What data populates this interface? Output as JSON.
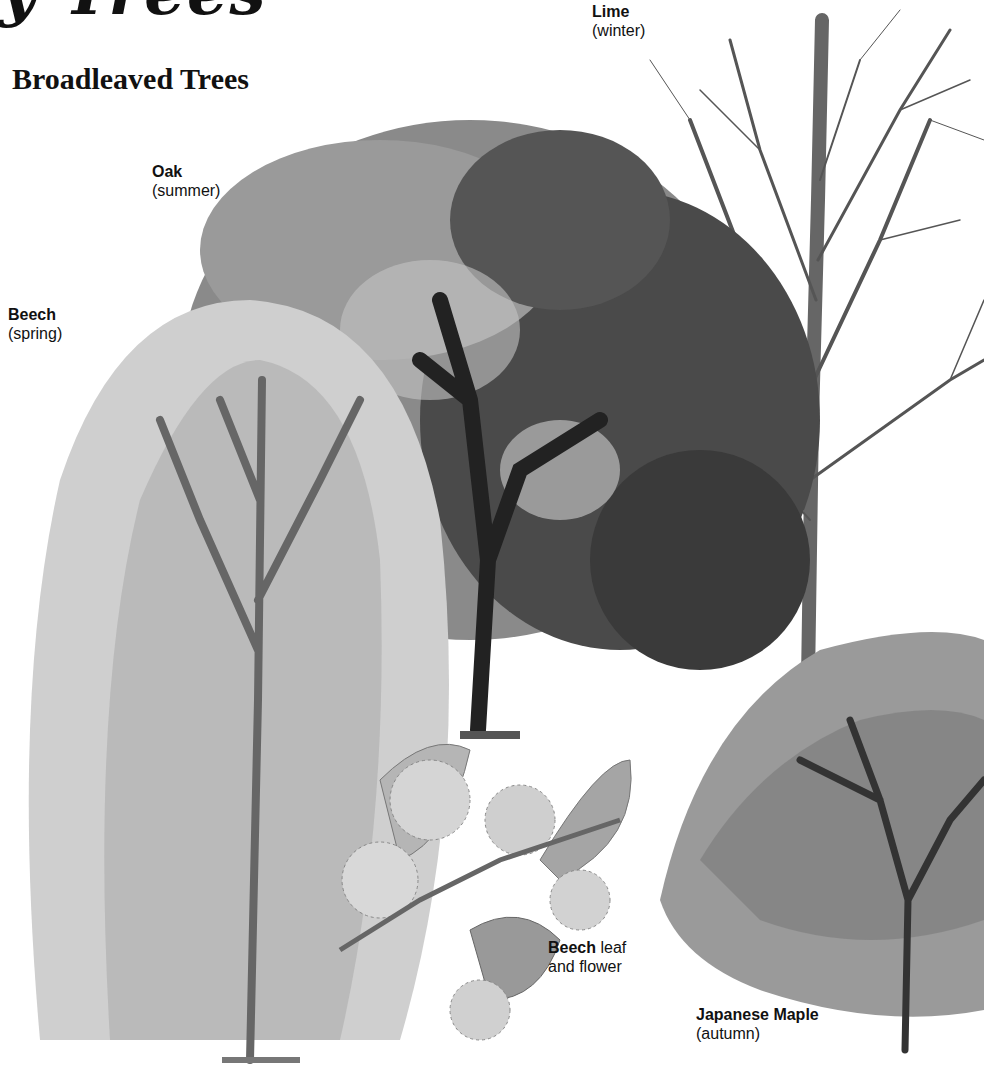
{
  "page": {
    "heading_cropped": "y Trees",
    "section_title": "Broadleaved Trees"
  },
  "labels": {
    "lime": {
      "name": "Lime",
      "season": "(winter)"
    },
    "oak": {
      "name": "Oak",
      "season": "(summer)"
    },
    "beech": {
      "name": "Beech",
      "season": "(spring)"
    },
    "beech_leaf": {
      "name": "Beech",
      "rest_line1": " leaf",
      "line2": "and flower"
    },
    "japanese_maple": {
      "name": "Japanese Maple",
      "season": "(autumn)"
    }
  },
  "colors": {
    "ink": "#111111",
    "dark_foliage": "#3a3a3a",
    "mid_foliage": "#7a7a7a",
    "light_foliage": "#b8b8b8",
    "pale_foliage": "#d8d8d8",
    "background": "#ffffff"
  }
}
